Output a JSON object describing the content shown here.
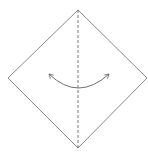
{
  "diagram": {
    "type": "origami-fold-step",
    "paper": {
      "shape": "diamond",
      "vertices": {
        "top": [
          78,
          10
        ],
        "right": [
          147,
          78
        ],
        "bottom": [
          78,
          148
        ],
        "left": [
          8,
          78
        ]
      },
      "stroke": "#8a8a8a"
    },
    "fold_line": {
      "style": "dashed",
      "orientation": "vertical",
      "from": [
        78,
        10
      ],
      "to": [
        78,
        148
      ],
      "stroke": "#6a6a6a"
    },
    "arrow": {
      "kind": "curved-double-headed",
      "meaning": "fold and unfold",
      "start": [
        48,
        73
      ],
      "end": [
        110,
        73
      ],
      "lowest_point": [
        78,
        88
      ],
      "stroke": "#707070"
    }
  }
}
